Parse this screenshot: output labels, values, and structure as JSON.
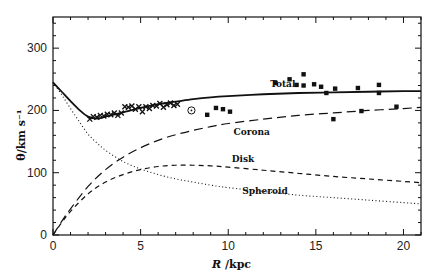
{
  "chart_data": {
    "type": "line",
    "title": "",
    "xlabel": "R /kpc",
    "xlabel_italic_part": "R",
    "xlabel_rest": " /kpc",
    "ylabel": "θ/km s⁻¹",
    "xlim": [
      0,
      21
    ],
    "ylim": [
      0,
      350
    ],
    "xticks": [
      0,
      5,
      10,
      15,
      20
    ],
    "yticks": [
      0,
      100,
      200,
      300
    ],
    "x_minor_step": 1,
    "y_minor_step": 20,
    "grid": false,
    "legend": "inline annotations",
    "series": [
      {
        "name": "Total",
        "style": "solid",
        "x": [
          0,
          0.5,
          1,
          1.5,
          2,
          2.5,
          3,
          4,
          5,
          6,
          7,
          8,
          9,
          10,
          12,
          14,
          16,
          18,
          20,
          21
        ],
        "y": [
          245,
          230,
          215,
          201,
          190,
          187,
          190,
          197,
          204,
          210,
          214,
          218,
          221,
          223,
          226,
          228,
          229,
          230,
          231,
          231
        ]
      },
      {
        "name": "Corona",
        "style": "long-dash",
        "x": [
          0,
          0.5,
          1,
          2,
          3,
          4,
          5,
          6,
          7,
          8,
          9,
          10,
          12,
          14,
          16,
          18,
          20,
          21
        ],
        "y": [
          0,
          22,
          42,
          78,
          105,
          125,
          140,
          152,
          161,
          168,
          174,
          179,
          186,
          192,
          196,
          200,
          203,
          205
        ]
      },
      {
        "name": "Disk",
        "style": "short-dash",
        "x": [
          0,
          0.5,
          1,
          2,
          3,
          4,
          5,
          6,
          7,
          8,
          9,
          10,
          12,
          14,
          16,
          18,
          20,
          21
        ],
        "y": [
          0,
          20,
          38,
          66,
          85,
          97,
          105,
          110,
          112,
          112,
          111,
          109,
          104,
          99,
          94,
          90,
          86,
          84
        ]
      },
      {
        "name": "Spheroid",
        "style": "dotted",
        "x": [
          0,
          0.5,
          1,
          1.5,
          2,
          2.5,
          3,
          4,
          5,
          6,
          7,
          8,
          9,
          10,
          12,
          14,
          16,
          18,
          20,
          21
        ],
        "y": [
          245,
          225,
          203,
          182,
          162,
          148,
          136,
          118,
          106,
          97,
          90,
          85,
          80,
          76,
          70,
          64,
          60,
          56,
          52,
          50
        ]
      }
    ],
    "observations": {
      "crosses": {
        "name": "HI tangent-point data",
        "x": [
          2.1,
          2.3,
          2.5,
          2.7,
          2.9,
          3.1,
          3.3,
          3.5,
          3.7,
          3.9,
          4.1,
          4.3,
          4.5,
          4.7,
          4.9,
          5.1,
          5.3,
          5.5,
          5.7,
          5.9,
          6.1,
          6.3,
          6.5,
          6.7,
          6.9,
          7.1
        ],
        "y": [
          186,
          190,
          189,
          192,
          191,
          194,
          193,
          196,
          192,
          196,
          206,
          205,
          207,
          202,
          206,
          198,
          206,
          203,
          208,
          207,
          211,
          205,
          209,
          212,
          208,
          210
        ]
      },
      "circled_dot": {
        "name": "Sun",
        "x": 7.9,
        "y": 200
      },
      "squares": {
        "name": "outer disk data",
        "x": [
          8.8,
          9.3,
          9.7,
          10.1,
          12.7,
          13.5,
          13.9,
          14.3,
          14.3,
          14.9,
          15.3,
          15.6,
          16.0,
          16.1,
          17.4,
          17.6,
          18.6,
          18.6,
          19.6
        ],
        "y": [
          193,
          204,
          202,
          198,
          244,
          250,
          241,
          258,
          240,
          242,
          238,
          228,
          186,
          235,
          236,
          199,
          241,
          228,
          206
        ]
      }
    },
    "annotations": [
      {
        "text": "Total",
        "x": 12.4,
        "y": 238
      },
      {
        "text": "Corona",
        "x": 10.3,
        "y": 160
      },
      {
        "text": "Disk",
        "x": 10.2,
        "y": 118
      },
      {
        "text": "Spheroid",
        "x": 10.8,
        "y": 66
      }
    ]
  },
  "colors": {
    "ink": "#111111",
    "background": "#ffffff"
  }
}
